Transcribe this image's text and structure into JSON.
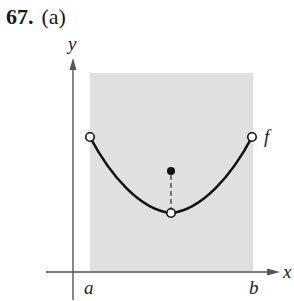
{
  "header": {
    "problem_number": "67.",
    "part": "(a)"
  },
  "diagram": {
    "axes": {
      "x_label": "x",
      "y_label": "y"
    },
    "interval": {
      "left_label": "a",
      "right_label": "b",
      "shade_color": "#e0e0e0"
    },
    "function_label": "f",
    "curve": "U-shaped curve on open interval (a, b) with open endpoints",
    "points": {
      "left_endpoint": "open",
      "right_endpoint": "open",
      "minimum": "open (hole)",
      "isolated_value": "filled dot above the hole, connected by dashed vertical line"
    },
    "colors": {
      "curve": "#111111",
      "axes": "#555555"
    }
  }
}
